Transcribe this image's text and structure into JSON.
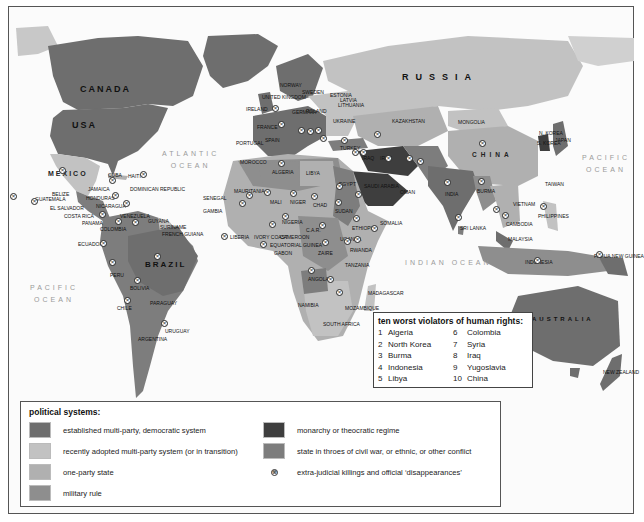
{
  "map": {
    "title": "political systems and human rights",
    "colors": {
      "democratic": "#6e6e6e",
      "transition": "#c2c2c2",
      "one_party": "#b0b0b0",
      "military": "#8e8e8e",
      "monarchy": "#3e3e3e",
      "conflict": "#7d7d7d",
      "water": "#fbfbfb"
    },
    "oceans": {
      "atlantic": "ATLANTIC OCEAN",
      "atlantic_l1": "ATLANTIC",
      "atlantic_l2": "OCEAN",
      "pacific_west_l1": "PACIFIC",
      "pacific_west_l2": "OCEAN",
      "pacific_east_l1": "PACIFIC",
      "pacific_east_l2": "OCEAN",
      "indian": "INDIAN OCEAN"
    },
    "major_labels": {
      "canada": "CANADA",
      "usa": "USA",
      "mexico": "MEXICO",
      "brazil": "BRAZIL",
      "russia": "RUSSIA",
      "china": "CHINA",
      "australia": "AUSTRALIA"
    },
    "country_labels": [
      {
        "name": "CUBA",
        "x": 108,
        "y": 172
      },
      {
        "name": "HAITI",
        "x": 128,
        "y": 173
      },
      {
        "name": "JAMAICA",
        "x": 88,
        "y": 186
      },
      {
        "name": "DOMINICAN REPUBLIC",
        "x": 130,
        "y": 186
      },
      {
        "name": "BELIZE",
        "x": 52,
        "y": 191
      },
      {
        "name": "HONDURAS",
        "x": 86,
        "y": 195
      },
      {
        "name": "GUATEMALA",
        "x": 35,
        "y": 196
      },
      {
        "name": "EL SALVADOR",
        "x": 50,
        "y": 205
      },
      {
        "name": "NICARAGUA",
        "x": 96,
        "y": 203
      },
      {
        "name": "COSTA RICA",
        "x": 64,
        "y": 213
      },
      {
        "name": "PANAMA",
        "x": 82,
        "y": 220
      },
      {
        "name": "VENEZUELA",
        "x": 120,
        "y": 213
      },
      {
        "name": "GUYANA",
        "x": 148,
        "y": 218
      },
      {
        "name": "SURINAME",
        "x": 160,
        "y": 224
      },
      {
        "name": "FRENCH GUIANA",
        "x": 162,
        "y": 231
      },
      {
        "name": "COLOMBIA",
        "x": 100,
        "y": 226
      },
      {
        "name": "ECUADOR",
        "x": 78,
        "y": 241
      },
      {
        "name": "PERU",
        "x": 110,
        "y": 272
      },
      {
        "name": "BOLIVIA",
        "x": 130,
        "y": 285
      },
      {
        "name": "PARAGUAY",
        "x": 150,
        "y": 300
      },
      {
        "name": "CHILE",
        "x": 117,
        "y": 305
      },
      {
        "name": "URUGUAY",
        "x": 165,
        "y": 328
      },
      {
        "name": "ARGENTINA",
        "x": 138,
        "y": 336
      },
      {
        "name": "NORWAY",
        "x": 280,
        "y": 82
      },
      {
        "name": "SWEDEN",
        "x": 302,
        "y": 89
      },
      {
        "name": "ESTONIA",
        "x": 330,
        "y": 92
      },
      {
        "name": "LATVIA",
        "x": 340,
        "y": 97
      },
      {
        "name": "LITHUANIA",
        "x": 338,
        "y": 102
      },
      {
        "name": "UNITED KINGDOM",
        "x": 262,
        "y": 94
      },
      {
        "name": "IRELAND",
        "x": 246,
        "y": 106
      },
      {
        "name": "GERMANY",
        "x": 292,
        "y": 109
      },
      {
        "name": "POLAND",
        "x": 306,
        "y": 108
      },
      {
        "name": "UKRAINE",
        "x": 333,
        "y": 118
      },
      {
        "name": "KAZAKHSTAN",
        "x": 392,
        "y": 118
      },
      {
        "name": "MONGOLIA",
        "x": 458,
        "y": 119
      },
      {
        "name": "FRANCE",
        "x": 257,
        "y": 124
      },
      {
        "name": "SPAIN",
        "x": 265,
        "y": 137
      },
      {
        "name": "PORTUGAL",
        "x": 236,
        "y": 140
      },
      {
        "name": "TURKEY",
        "x": 340,
        "y": 145
      },
      {
        "name": "MOROCCO",
        "x": 240,
        "y": 159
      },
      {
        "name": "ALGERIA",
        "x": 272,
        "y": 169
      },
      {
        "name": "LIBYA",
        "x": 306,
        "y": 170
      },
      {
        "name": "EGYPT",
        "x": 339,
        "y": 181
      },
      {
        "name": "IRAN",
        "x": 380,
        "y": 155
      },
      {
        "name": "IRAQ",
        "x": 362,
        "y": 155
      },
      {
        "name": "SAUDI ARABIA",
        "x": 364,
        "y": 183
      },
      {
        "name": "OMAN",
        "x": 400,
        "y": 189
      },
      {
        "name": "INDIA",
        "x": 445,
        "y": 191
      },
      {
        "name": "BURMA",
        "x": 477,
        "y": 188
      },
      {
        "name": "N. KOREA",
        "x": 539,
        "y": 130
      },
      {
        "name": "S. KOREA",
        "x": 537,
        "y": 140
      },
      {
        "name": "JAPAN",
        "x": 555,
        "y": 137
      },
      {
        "name": "TAIWAN",
        "x": 545,
        "y": 181
      },
      {
        "name": "VIETNAM",
        "x": 513,
        "y": 201
      },
      {
        "name": "CAMBODIA",
        "x": 506,
        "y": 221
      },
      {
        "name": "PHILIPPINES",
        "x": 538,
        "y": 213
      },
      {
        "name": "SRI LANKA",
        "x": 460,
        "y": 225
      },
      {
        "name": "MALAYSIA",
        "x": 508,
        "y": 236
      },
      {
        "name": "INDONESIA",
        "x": 525,
        "y": 259
      },
      {
        "name": "PAPUA NEW GUINEA",
        "x": 594,
        "y": 253
      },
      {
        "name": "SENEGAL",
        "x": 203,
        "y": 195
      },
      {
        "name": "GAMBIA",
        "x": 203,
        "y": 208
      },
      {
        "name": "MAURITANIA",
        "x": 234,
        "y": 188
      },
      {
        "name": "MALI",
        "x": 270,
        "y": 199
      },
      {
        "name": "NIGER",
        "x": 290,
        "y": 199
      },
      {
        "name": "CHAD",
        "x": 313,
        "y": 202
      },
      {
        "name": "SUDAN",
        "x": 335,
        "y": 208
      },
      {
        "name": "ETHIOPIA",
        "x": 352,
        "y": 225
      },
      {
        "name": "SOMALIA",
        "x": 380,
        "y": 220
      },
      {
        "name": "NIGERIA",
        "x": 282,
        "y": 219
      },
      {
        "name": "LIBERIA",
        "x": 230,
        "y": 234
      },
      {
        "name": "IVORY COAST",
        "x": 254,
        "y": 234
      },
      {
        "name": "CAMEROON",
        "x": 280,
        "y": 234
      },
      {
        "name": "EQUATORIAL GUINEA",
        "x": 270,
        "y": 242
      },
      {
        "name": "GABON",
        "x": 274,
        "y": 250
      },
      {
        "name": "C.A.R.",
        "x": 306,
        "y": 227
      },
      {
        "name": "UGANDA",
        "x": 340,
        "y": 236
      },
      {
        "name": "RWANDA",
        "x": 350,
        "y": 247
      },
      {
        "name": "ZAIRE",
        "x": 318,
        "y": 250
      },
      {
        "name": "TANZANIA",
        "x": 345,
        "y": 262
      },
      {
        "name": "ANGOLA",
        "x": 308,
        "y": 276
      },
      {
        "name": "MADAGASCAR",
        "x": 368,
        "y": 290
      },
      {
        "name": "NAMIBIA",
        "x": 298,
        "y": 302
      },
      {
        "name": "MOZAMBIQUE",
        "x": 345,
        "y": 305
      },
      {
        "name": "SOUTH AFRICA",
        "x": 323,
        "y": 321
      },
      {
        "name": "NEW ZEALAND",
        "x": 603,
        "y": 369
      }
    ],
    "markers": [
      [
        62,
        170
      ],
      [
        112,
        180
      ],
      [
        143,
        174
      ],
      [
        115,
        195
      ],
      [
        13,
        196
      ],
      [
        34,
        201
      ],
      [
        126,
        203
      ],
      [
        102,
        214
      ],
      [
        118,
        221
      ],
      [
        135,
        222
      ],
      [
        103,
        243
      ],
      [
        157,
        256
      ],
      [
        112,
        262
      ],
      [
        137,
        280
      ],
      [
        127,
        300
      ],
      [
        164,
        323
      ],
      [
        275,
        108
      ],
      [
        281,
        124
      ],
      [
        301,
        130
      ],
      [
        310,
        131
      ],
      [
        318,
        130
      ],
      [
        323,
        138
      ],
      [
        344,
        140
      ],
      [
        377,
        134
      ],
      [
        355,
        152
      ],
      [
        363,
        152
      ],
      [
        388,
        158
      ],
      [
        409,
        158
      ],
      [
        420,
        161
      ],
      [
        482,
        143
      ],
      [
        447,
        182
      ],
      [
        481,
        181
      ],
      [
        496,
        209
      ],
      [
        505,
        215
      ],
      [
        458,
        217
      ],
      [
        543,
        206
      ],
      [
        537,
        260
      ],
      [
        599,
        254
      ],
      [
        281,
        163
      ],
      [
        249,
        195
      ],
      [
        242,
        203
      ],
      [
        267,
        192
      ],
      [
        293,
        193
      ],
      [
        314,
        196
      ],
      [
        339,
        186
      ],
      [
        338,
        202
      ],
      [
        358,
        194
      ],
      [
        356,
        218
      ],
      [
        374,
        228
      ],
      [
        285,
        216
      ],
      [
        272,
        224
      ],
      [
        322,
        225
      ],
      [
        224,
        236
      ],
      [
        263,
        244
      ],
      [
        325,
        242
      ],
      [
        347,
        241
      ],
      [
        357,
        239
      ],
      [
        311,
        270
      ],
      [
        330,
        279
      ],
      [
        339,
        292
      ]
    ]
  },
  "violators": {
    "title": "ten worst violators of human rights:",
    "left": [
      {
        "num": "1",
        "name": "Algeria"
      },
      {
        "num": "2",
        "name": "North Korea"
      },
      {
        "num": "3",
        "name": "Burma"
      },
      {
        "num": "4",
        "name": "Indonesia"
      },
      {
        "num": "5",
        "name": "Libya"
      }
    ],
    "right": [
      {
        "num": "6",
        "name": "Colombia"
      },
      {
        "num": "7",
        "name": "Syria"
      },
      {
        "num": "8",
        "name": "Iraq"
      },
      {
        "num": "9",
        "name": "Yugoslavia"
      },
      {
        "num": "10",
        "name": "China"
      }
    ]
  },
  "legend": {
    "title": "political systems:",
    "items": [
      {
        "label": "established multi-party, democratic system",
        "color": "#6e6e6e"
      },
      {
        "label": "recently adopted multi-party system (or in transition)",
        "color": "#c2c2c2"
      },
      {
        "label": "one-party state",
        "color": "#b0b0b0"
      },
      {
        "label": "military rule",
        "color": "#8e8e8e"
      },
      {
        "label": "monarchy or theocratic regime",
        "color": "#3e3e3e"
      },
      {
        "label": "state in throes of civil war, or ethnic, or other conflict",
        "color": "#7d7d7d"
      },
      {
        "label": "extra-judicial killings and official ‘disappearances’",
        "symbol": "⊗"
      }
    ]
  }
}
